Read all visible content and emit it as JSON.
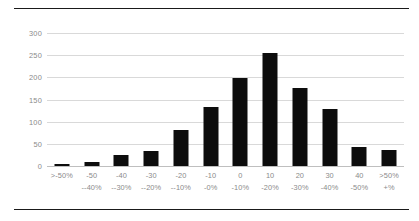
{
  "chart_data": {
    "type": "bar",
    "title": "",
    "subtitle": "",
    "xlabel": "",
    "ylabel": "",
    "ylim": [
      0,
      300
    ],
    "yticks": [
      0,
      50,
      100,
      150,
      200,
      250,
      300
    ],
    "ytick_labels": [
      "0",
      "50",
      "100",
      "150",
      "200",
      "250",
      "300"
    ],
    "grid": true,
    "legend": false,
    "legend_position": "none",
    "bar_color": "#0d0d0d",
    "grid_color": "#d9d9d9",
    "tick_label_color": "#8a8a8a",
    "categories": [
      ">-50%",
      "-50--40%",
      "-40--30%",
      "-30--20%",
      "-20--10%",
      "-10-0%",
      "0--10%",
      "10--20%",
      "20--30%",
      "30--40%",
      "40--50%",
      ">50%+%"
    ],
    "category_lines": [
      {
        "line1": ">-50%",
        "line2": ""
      },
      {
        "line1": "-50",
        "line2": "--40%"
      },
      {
        "line1": "-40",
        "line2": "--30%"
      },
      {
        "line1": "-30",
        "line2": "--20%"
      },
      {
        "line1": "-20",
        "line2": "--10%"
      },
      {
        "line1": "-10",
        "line2": "-0%"
      },
      {
        "line1": "0",
        "line2": "-10%"
      },
      {
        "line1": "10",
        "line2": "-20%"
      },
      {
        "line1": "20",
        "line2": "-30%"
      },
      {
        "line1": "30",
        "line2": "-40%"
      },
      {
        "line1": "40",
        "line2": "-50%"
      },
      {
        "line1": ">50%",
        "line2": "+%"
      }
    ],
    "values": [
      5,
      8,
      25,
      34,
      81,
      133,
      198,
      256,
      176,
      128,
      43,
      36
    ]
  }
}
